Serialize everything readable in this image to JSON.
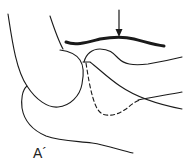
{
  "figure": {
    "label": "A´",
    "stroke_color": "#1a1a1a",
    "background": "#ffffff",
    "elements": {
      "arrow": "down-arrow-indicator",
      "thick_bar": "highlighted-contour",
      "dashed_line": "hidden-contour"
    }
  }
}
